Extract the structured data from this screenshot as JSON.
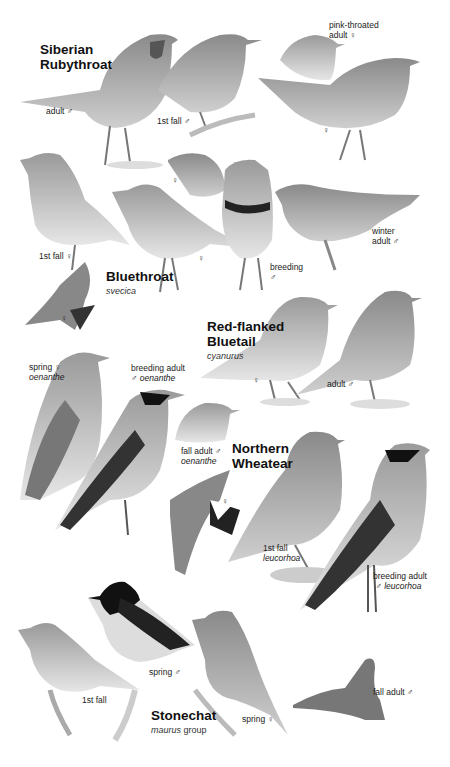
{
  "plate": {
    "background": "#ffffff",
    "species": [
      {
        "name_line1": "Siberian",
        "name_line2": "Rubythroat",
        "figures": [
          {
            "label": "adult ♂"
          },
          {
            "label": "1st fall ♂"
          },
          {
            "label_line1": "pink-throated",
            "label_line2": "adult ♀"
          },
          {
            "label": "♀"
          }
        ]
      },
      {
        "name": "Bluethroat",
        "subspecies": "svecica",
        "figures": [
          {
            "label": "1st fall ♀"
          },
          {
            "label": "♀"
          },
          {
            "label": "♀"
          },
          {
            "label_line1": "breeding",
            "label_line2": "♂"
          },
          {
            "label_line1": "winter",
            "label_line2": "adult ♂"
          },
          {
            "label": "♀"
          }
        ]
      },
      {
        "name_line1": "Red-flanked",
        "name_line2": "Bluetail",
        "subspecies": "cyanurus",
        "figures": [
          {
            "label": "♀"
          },
          {
            "label": "adult ♂"
          }
        ]
      },
      {
        "name_line1": "Northern",
        "name_line2": "Wheatear",
        "figures": [
          {
            "label_line1": "spring ♀",
            "label_line2": "oenanthe"
          },
          {
            "label_line1": "breeding adult",
            "label_line2_sym": "♂",
            "label_line2": "oenanthe"
          },
          {
            "label_line1": "fall adult ♂",
            "label_line2": "oenanthe"
          },
          {
            "label": "♀"
          },
          {
            "label_line1": "1st fall",
            "label_line2": "leucorhoa"
          },
          {
            "label_line1": "breeding adult",
            "label_line2_sym": "♂",
            "label_line2": "leucorhoa"
          }
        ]
      },
      {
        "name": "Stonechat",
        "subspecies": "maurus",
        "subspecies_suffix": "group",
        "figures": [
          {
            "label": "1st fall"
          },
          {
            "label": "spring ♂"
          },
          {
            "label": "spring ♀"
          },
          {
            "label": "fall adult ♂"
          }
        ]
      }
    ]
  }
}
